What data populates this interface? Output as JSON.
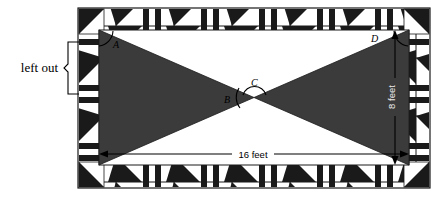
{
  "figure": {
    "kind": "geometry-diagram",
    "colors": {
      "dark": "#1a1a1a",
      "shaded": "#3b3b3b",
      "light": "#ffffff",
      "line": "#000000",
      "page": "#ffffff"
    }
  },
  "annotations": {
    "left_out_label": "left out",
    "vertex_a": "A",
    "vertex_b": "B",
    "vertex_c": "C",
    "vertex_d": "D"
  },
  "dimensions": {
    "width_label": "16 feet",
    "height_label": "8 feet",
    "width_value": 16,
    "height_value": 8,
    "units": "feet"
  },
  "border": {
    "motif": "half-square-triangle-and-stripes",
    "repeat_count_top": 5,
    "repeat_count_side": 3,
    "corner": "large-dark-triangle"
  }
}
